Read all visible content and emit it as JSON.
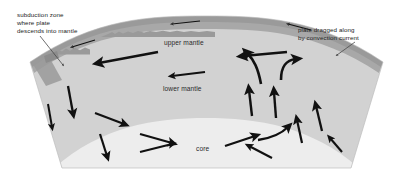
{
  "figure": {
    "width": 413,
    "height": 177,
    "background": "#ffffff"
  },
  "labels": {
    "subduction": "subduction zone\nwhere plate\ndescends into mantle",
    "plate_dragged": "plate dragged along\nby convection current",
    "upper_mantle": "upper mantle",
    "lower_mantle": "lower mantle",
    "core": "core"
  },
  "colors": {
    "background": "#ffffff",
    "crust": "#9a9a9a",
    "upper_mantle": "#a8a8a8",
    "lower_mantle": "#d2d2d2",
    "core": "#ededed",
    "arrow": "#111111",
    "text": "#1a1a1a",
    "pointer_line": "#4a4a4a"
  },
  "diagram": {
    "layer_names": [
      "crust",
      "upper mantle",
      "lower mantle",
      "core"
    ],
    "arrow_count": 22
  }
}
